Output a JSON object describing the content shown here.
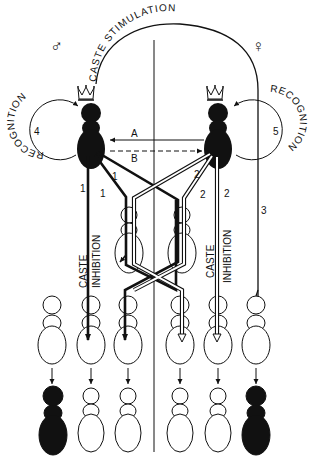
{
  "diagram": {
    "sex_symbols": {
      "male": "♂",
      "female": "♀"
    },
    "top_arc_label": "CASTE STIMULATION",
    "left_loop": {
      "label": "RECOGNITION",
      "number": "4"
    },
    "right_loop": {
      "label": "RECOGNITION",
      "number": "5"
    },
    "pair_arrows": {
      "a": "A",
      "b": "B"
    },
    "pathway_numbers": {
      "male_1a": "1",
      "male_1b": "1",
      "male_1c": "1",
      "female_2a": "2",
      "female_2b": "2",
      "female_2c": "2",
      "female_3": "3"
    },
    "left_inhibition": {
      "line1": "CASTE",
      "line2": "INHIBITION"
    },
    "right_inhibition": {
      "line1": "CASTE",
      "line2": "INHIBITION"
    },
    "legend_entities": {
      "royal_king": "crowned male reproductive (filled)",
      "royal_queen": "crowned female reproductive (filled)",
      "nymphs": "six outline nymphs in middle row",
      "outcomes": "six individuals in bottom row: 2 filled reproductives, 4 outline"
    },
    "colors": {
      "ink": "#111111",
      "paper": "#ffffff"
    }
  }
}
